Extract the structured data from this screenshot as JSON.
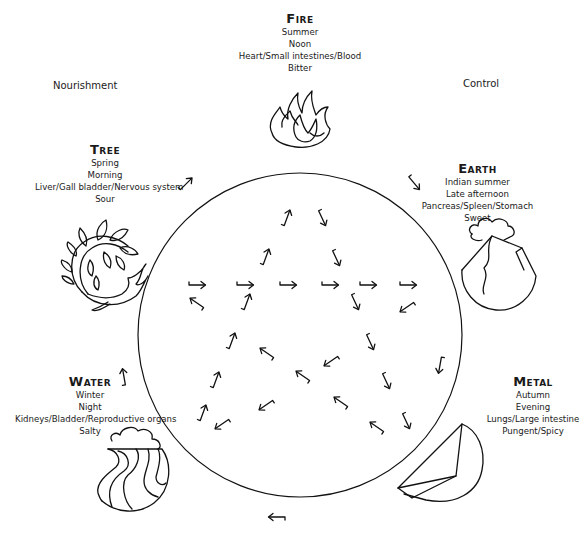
{
  "diagram": {
    "cycle_labels": {
      "nourishment": "Nourishment",
      "control": "Control"
    },
    "elements": [
      {
        "name": "Fire",
        "season": "Summer",
        "time": "Noon",
        "organs": "Heart/Small intestines/Blood",
        "taste": "Bitter",
        "icon": "flame-icon"
      },
      {
        "name": "Earth",
        "season": "Indian summer",
        "time": "Late afternoon",
        "organs": "Pancreas/Spleen/Stomach",
        "taste": "Sweet",
        "icon": "mountain-cloud-icon"
      },
      {
        "name": "Metal",
        "season": "Autumn",
        "time": "Evening",
        "organs": "Lungs/Large intestine",
        "taste": "Pungent/Spicy",
        "icon": "metal-wedge-icon"
      },
      {
        "name": "Water",
        "season": "Winter",
        "time": "Night",
        "organs": "Kidneys/Bladder/Reproductive organs",
        "taste": "Salty",
        "icon": "waves-icon"
      },
      {
        "name": "Tree",
        "season": "Spring",
        "time": "Morning",
        "organs": "Liver/Gall bladder/Nervous system",
        "taste": "Sour",
        "icon": "leafy-branch-icon"
      }
    ],
    "outer_arrows": [
      {
        "x": 186,
        "y": 184,
        "angle": -45
      },
      {
        "x": 414,
        "y": 183,
        "angle": 50
      },
      {
        "x": 440,
        "y": 365,
        "angle": 100
      },
      {
        "x": 277,
        "y": 517,
        "angle": 180
      },
      {
        "x": 124,
        "y": 377,
        "angle": -100
      }
    ],
    "inner_arrows": [
      {
        "x": 197,
        "y": 285,
        "angle": 0
      },
      {
        "x": 245,
        "y": 285,
        "angle": 0
      },
      {
        "x": 288,
        "y": 285,
        "angle": 0
      },
      {
        "x": 330,
        "y": 285,
        "angle": 0
      },
      {
        "x": 368,
        "y": 285,
        "angle": 0
      },
      {
        "x": 408,
        "y": 285,
        "angle": 0
      },
      {
        "x": 197,
        "y": 303,
        "angle": -145
      },
      {
        "x": 247,
        "y": 302,
        "angle": -70
      },
      {
        "x": 355,
        "y": 302,
        "angle": 65
      },
      {
        "x": 407,
        "y": 307,
        "angle": 145
      },
      {
        "x": 287,
        "y": 218,
        "angle": -70
      },
      {
        "x": 322,
        "y": 218,
        "angle": 65
      },
      {
        "x": 266,
        "y": 257,
        "angle": -70
      },
      {
        "x": 336,
        "y": 258,
        "angle": 65
      },
      {
        "x": 232,
        "y": 341,
        "angle": -70
      },
      {
        "x": 216,
        "y": 380,
        "angle": -70
      },
      {
        "x": 203,
        "y": 413,
        "angle": -70
      },
      {
        "x": 266,
        "y": 405,
        "angle": 145
      },
      {
        "x": 222,
        "y": 424,
        "angle": 145
      },
      {
        "x": 267,
        "y": 353,
        "angle": -145
      },
      {
        "x": 303,
        "y": 376,
        "angle": -145
      },
      {
        "x": 341,
        "y": 402,
        "angle": -145
      },
      {
        "x": 377,
        "y": 427,
        "angle": -145
      },
      {
        "x": 331,
        "y": 361,
        "angle": 145
      },
      {
        "x": 370,
        "y": 342,
        "angle": 65
      },
      {
        "x": 386,
        "y": 381,
        "angle": 65
      },
      {
        "x": 406,
        "y": 421,
        "angle": 65
      }
    ],
    "circle": {
      "cx": 300,
      "cy": 335,
      "r": 162
    }
  }
}
